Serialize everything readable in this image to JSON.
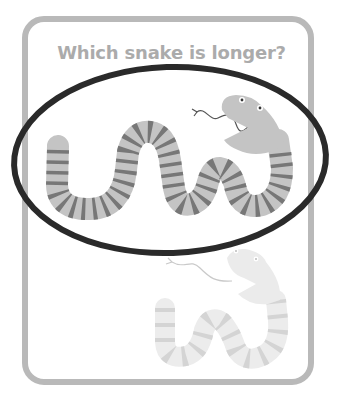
{
  "question": {
    "title": "Which snake is longer?"
  },
  "snakes": [
    {
      "id": "top",
      "selected": true,
      "body_color": "#c4c4c4",
      "stripe_color": "#767676",
      "opacity": 1
    },
    {
      "id": "bottom",
      "selected": false,
      "body_color": "#ececec",
      "stripe_color": "#d6d6d6",
      "opacity": 1
    }
  ],
  "colors": {
    "frame": "#b9b9b9",
    "title": "#ababab",
    "selection_ring": "#2a2a2a",
    "background": "#ffffff"
  }
}
